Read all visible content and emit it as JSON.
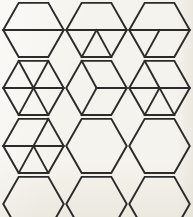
{
  "page": {
    "background_color": "#f5f3ed",
    "ink_color": "#2b2b2b",
    "rows": 4,
    "columns": 3,
    "shape": "hexagon",
    "total_shapes": 12
  },
  "figures": [
    {
      "index": 1,
      "row": 1,
      "column": 1,
      "name": "hexagon-halves",
      "divisions": 2,
      "internal_lines": [
        "horizontal-midline"
      ],
      "description": "Hexagon divided into two halves by a horizontal line through the center."
    },
    {
      "index": 2,
      "row": 1,
      "column": 2,
      "name": "hexagon-midline-with-bottom-v",
      "divisions": 4,
      "internal_lines": [
        "horizontal-midline",
        "center-to-bottom-left",
        "center-to-bottom-right"
      ],
      "description": "Hexagon with a horizontal midline and two diagonals forming an inverted triangle in the lower half."
    },
    {
      "index": 3,
      "row": 1,
      "column": 3,
      "name": "hexagon-midline-with-left-diagonal",
      "divisions": 3,
      "internal_lines": [
        "horizontal-midline",
        "center-to-bottom-left"
      ],
      "description": "Hexagon with a horizontal midline and one diagonal from the center to the bottom-left vertex."
    },
    {
      "index": 4,
      "row": 2,
      "column": 1,
      "name": "hexagon-sixths",
      "divisions": 6,
      "internal_lines": [
        "horizontal-midline",
        "center-to-top-left",
        "center-to-top-right",
        "center-to-bottom-left",
        "center-to-bottom-right"
      ],
      "description": "Hexagon fully divided into six triangles by three lines through the center."
    },
    {
      "index": 5,
      "row": 2,
      "column": 2,
      "name": "hexagon-cube",
      "divisions": 3,
      "internal_lines": [
        "center-to-right",
        "center-to-top-left",
        "center-to-bottom-left"
      ],
      "description": "Hexagon divided into three rhombi producing a cube illusion."
    },
    {
      "index": 6,
      "row": 2,
      "column": 3,
      "name": "hexagon-midline-with-three-diagonals-left-top",
      "divisions": 5,
      "internal_lines": [
        "horizontal-midline",
        "center-to-top-left",
        "center-to-bottom-left",
        "center-to-bottom-right"
      ],
      "description": "Hexagon with a horizontal midline, one upper-left diagonal and two lower diagonals."
    },
    {
      "index": 7,
      "row": 3,
      "column": 1,
      "name": "hexagon-midline-with-three-diagonals-right-top",
      "divisions": 5,
      "internal_lines": [
        "horizontal-midline",
        "center-to-top-right",
        "center-to-bottom-left",
        "center-to-bottom-right"
      ],
      "description": "Hexagon with a horizontal midline, one upper-right diagonal and two lower diagonals."
    },
    {
      "index": 8,
      "row": 3,
      "column": 2,
      "name": "hexagon-blank",
      "divisions": 1,
      "internal_lines": [],
      "description": "Plain undivided hexagon."
    },
    {
      "index": 9,
      "row": 3,
      "column": 3,
      "name": "hexagon-blank",
      "divisions": 1,
      "internal_lines": [],
      "description": "Plain undivided hexagon."
    },
    {
      "index": 10,
      "row": 4,
      "column": 1,
      "name": "hexagon-blank",
      "divisions": 1,
      "internal_lines": [],
      "description": "Plain undivided hexagon."
    },
    {
      "index": 11,
      "row": 4,
      "column": 2,
      "name": "hexagon-blank",
      "divisions": 1,
      "internal_lines": [],
      "description": "Plain undivided hexagon."
    },
    {
      "index": 12,
      "row": 4,
      "column": 3,
      "name": "hexagon-blank",
      "divisions": 1,
      "internal_lines": [],
      "description": "Plain undivided hexagon."
    }
  ],
  "geometry": {
    "viewbox": "0 0 100 92",
    "vertices": {
      "left": [
        2,
        46
      ],
      "top_left": [
        26.5,
        3
      ],
      "top_right": [
        73.5,
        3
      ],
      "right": [
        98,
        46
      ],
      "bottom_right": [
        73.5,
        89
      ],
      "bottom_left": [
        26.5,
        89
      ]
    },
    "center": [
      50,
      46
    ]
  }
}
